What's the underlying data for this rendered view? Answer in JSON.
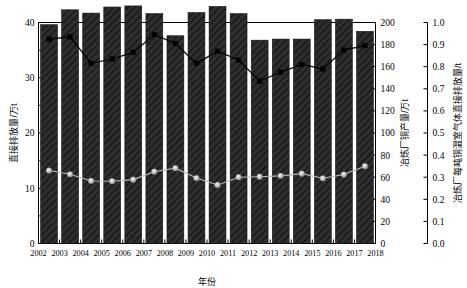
{
  "chart_data": {
    "type": "bar",
    "title": "",
    "subtitle": "",
    "xlabel": "年份",
    "ylabel": "直接排放量/万t",
    "ylabel_right_1": "冶炼厂铜产量/万t",
    "ylabel_right_2": "冶炼厂每吨铜温室气体直接排放量/t",
    "grid": false,
    "legend": "none",
    "categories": [
      "2002",
      "2003",
      "2004",
      "2005",
      "2006",
      "2007",
      "2008",
      "2009",
      "2010",
      "2011",
      "2012",
      "2013",
      "2014",
      "2015",
      "2016",
      "2017"
    ],
    "x_tick_labels": [
      "2002",
      "2003",
      "2004",
      "2005",
      "2006",
      "2007",
      "2008",
      "2009",
      "2010",
      "2011",
      "2012",
      "2013",
      "2014",
      "2015",
      "2016",
      "2017",
      "2018"
    ],
    "ylim": [
      0,
      40
    ],
    "y_tick_labels": [
      "0",
      "10",
      "20",
      "30",
      "40"
    ],
    "y_ticks": [
      0,
      10,
      20,
      30,
      40
    ],
    "ylim_right_1": [
      0,
      200
    ],
    "y_right_1_tick_labels": [
      "0",
      "20",
      "40",
      "60",
      "80",
      "100",
      "120",
      "140",
      "160",
      "180",
      "200"
    ],
    "y_right_1_ticks": [
      0,
      20,
      40,
      60,
      80,
      100,
      120,
      140,
      160,
      180,
      200
    ],
    "ylim_right_2": [
      0,
      1.0
    ],
    "y_right_2_tick_labels": [
      "0.0",
      "0.1",
      "0.2",
      "0.3",
      "0.4",
      "0.5",
      "0.6",
      "0.7",
      "0.8",
      "0.9",
      "1.0"
    ],
    "y_right_2_ticks": [
      0,
      0.1,
      0.2,
      0.3,
      0.4,
      0.5,
      0.6,
      0.7,
      0.8,
      0.9,
      1.0
    ],
    "series": [
      {
        "name": "直接排放量/万t",
        "kind": "bar",
        "axis": "left",
        "color": "#2e2e2e",
        "values": [
          39.6,
          42.3,
          41.7,
          42.8,
          43.0,
          41.6,
          37.6,
          41.8,
          42.9,
          41.6,
          36.8,
          37.0,
          37.0,
          40.5,
          40.6,
          38.4
        ]
      },
      {
        "name": "冶炼厂铜产量/万t",
        "kind": "line-square",
        "axis": "right1",
        "color": "#000000",
        "values": [
          185,
          187,
          163,
          167,
          173,
          189,
          181,
          163,
          174,
          166,
          147,
          155,
          162,
          158,
          175,
          179
        ]
      },
      {
        "name": "冶炼厂每吨铜温室气体直接排放量/t",
        "kind": "line-circle",
        "axis": "right2",
        "color": "#b9b9b9",
        "values": [
          0.33,
          0.313,
          0.283,
          0.282,
          0.289,
          0.325,
          0.341,
          0.296,
          0.265,
          0.3,
          0.302,
          0.306,
          0.316,
          0.295,
          0.312,
          0.35
        ]
      }
    ]
  }
}
